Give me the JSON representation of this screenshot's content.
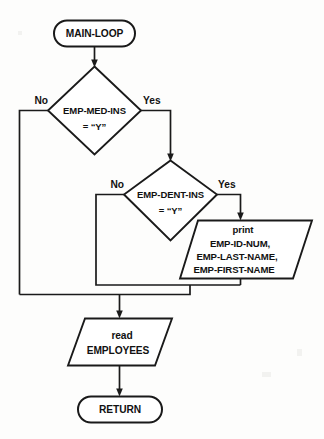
{
  "diagram": {
    "type": "flowchart",
    "line_color": "#1a1a1a",
    "shape_fill": "#ffffff",
    "background": "#fdfdfc",
    "nodes": [
      {
        "id": "start",
        "shape": "terminator",
        "lines": [
          "MAIN-LOOP"
        ]
      },
      {
        "id": "decision_med",
        "shape": "decision",
        "lines": [
          "EMP-MED-INS",
          "= “Y”"
        ],
        "line1": "EMP-MED-INS",
        "line2": "= “Y”"
      },
      {
        "id": "decision_dent",
        "shape": "decision",
        "lines": [
          "EMP-DENT-INS",
          "= “Y”"
        ],
        "line1": "EMP-DENT-INS",
        "line2": "= “Y”"
      },
      {
        "id": "print_io",
        "shape": "parallelogram",
        "lines": [
          "print",
          "EMP-ID-NUM,",
          "EMP-LAST-NAME,",
          "EMP-FIRST-NAME"
        ],
        "line1": "print",
        "line2": "EMP-ID-NUM,",
        "line3": "EMP-LAST-NAME,",
        "line4": "EMP-FIRST-NAME"
      },
      {
        "id": "read_io",
        "shape": "parallelogram",
        "lines": [
          "read",
          "EMPLOYEES"
        ],
        "line1": "read",
        "line2": "EMPLOYEES"
      },
      {
        "id": "end",
        "shape": "terminator",
        "lines": [
          "RETURN"
        ]
      }
    ],
    "branch_labels": {
      "med_no": "No",
      "med_yes": "Yes",
      "dent_no": "No",
      "dent_yes": "Yes"
    }
  }
}
